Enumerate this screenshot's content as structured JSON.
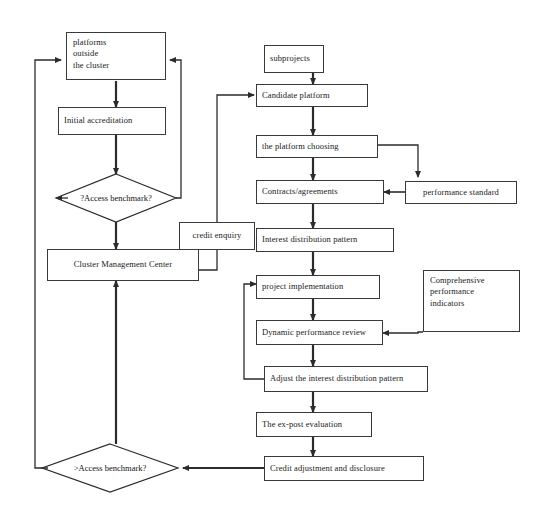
{
  "diagram": {
    "background_color": "#ffffff",
    "line_color": "#2b2b2b",
    "text_color": "#1a1a1a",
    "nodes": {
      "platforms_outside": {
        "line1": "platforms",
        "line2": "outside",
        "line3": "the cluster"
      },
      "initial_accreditation": {
        "label": "Initial accreditation"
      },
      "access_benchmark_1": {
        "label": "?Access benchmark?"
      },
      "cluster_management_center": {
        "label": "Cluster Management Center"
      },
      "access_benchmark_2": {
        "label": ">Access benchmark?"
      },
      "credit_enquiry": {
        "label": "credit enquiry"
      },
      "subprojects": {
        "label": "subprojects"
      },
      "candidate_platform": {
        "label": "Candidate platform"
      },
      "platform_choosing": {
        "label": "the platform choosing"
      },
      "contracts_agreements": {
        "label": "Contracts/agreements"
      },
      "performance_standard": {
        "label": "performance standard"
      },
      "interest_distribution_pattern": {
        "label": "Interest distribution pattern"
      },
      "project_implementation": {
        "label": "project implementation"
      },
      "dynamic_performance_review": {
        "label": "Dynamic performance review"
      },
      "comprehensive_indicators": {
        "line1": "Comprehensive",
        "line2": "performance",
        "line3": "indicators"
      },
      "adjust_interest_distribution": {
        "label": "Adjust the interest distribution pattern"
      },
      "ex_post_evaluation": {
        "label": "The ex-post evaluation"
      },
      "credit_adjustment": {
        "label": "Credit adjustment and disclosure"
      }
    }
  }
}
